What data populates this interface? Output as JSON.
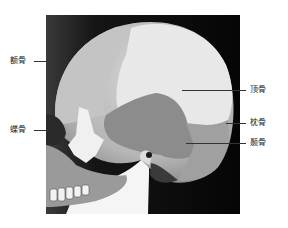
{
  "figure": {
    "labels": {
      "frontal": "额骨",
      "sphenoid": "蝶骨",
      "parietal": "顶骨",
      "occipital": "枕骨",
      "temporal": "颞骨"
    }
  },
  "colors": {
    "background": "#ffffff",
    "photo_bg": "#0a0a0a",
    "bone_light": "#e6e6e6",
    "bone_mid": "#a8a8a8",
    "bone_dark": "#6e6e6e",
    "leader_line": "#333333"
  }
}
